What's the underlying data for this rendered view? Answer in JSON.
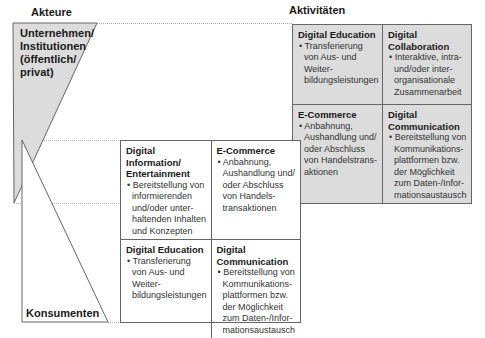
{
  "headings": {
    "actors": "Akteure",
    "activities": "Aktivitäten"
  },
  "actors": {
    "businesses": "Unternehmen/ Institutionen (öffentlich/ privat)",
    "consumers": "Konsumenten"
  },
  "business_grid": {
    "cells": [
      {
        "title": "Digital Education",
        "body": "Transferierung von Aus- und Weiter-bildungsleistungen"
      },
      {
        "title": "Digital Collaboration",
        "body": "Interaktive, intra- und/oder inter-organisationale Zusammenarbeit"
      },
      {
        "title": "E-Commerce",
        "body": "Anbahnung, Aushandlung und/ oder Abschluss von Handelstrans-aktionen"
      },
      {
        "title": "Digital Communication",
        "body": "Bereitstellung von Kommunikations-plattformen bzw. der Möglichkeit zum Daten-/Infor-mationsaustausch"
      }
    ]
  },
  "consumer_grid": {
    "cells": [
      {
        "title": "Digital Information/ Entertainment",
        "body": "Bereitstellung von informierenden und/oder unter-haltenden Inhalten und Konzepten"
      },
      {
        "title": "E-Commerce",
        "body": "Anbahnung, Aushandlung und/ oder Abschluss von Handels-transaktionen"
      },
      {
        "title": "Digital Education",
        "body": "Transferierung von Aus- und Weiter-bildungsleistungen"
      },
      {
        "title": "Digital Communication",
        "body": "Bereitstellung von Kommunikations-plattformen bzw. der Möglichkeit zum Daten-/Infor-mationsaustausch"
      }
    ]
  },
  "colors": {
    "business_fill": "#dcdcdc",
    "line": "#666666",
    "dotted": "#aaaaaa"
  }
}
